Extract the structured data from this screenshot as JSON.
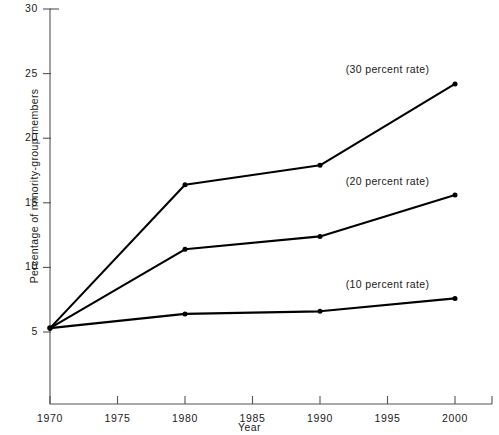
{
  "chart_data": {
    "type": "line",
    "title": "",
    "xlabel": "Year",
    "ylabel": "Percentage of minority-group members",
    "x": [
      1970,
      1980,
      1990,
      2000
    ],
    "xlim": [
      1970,
      2002
    ],
    "ylim": [
      0,
      30
    ],
    "xticks": [
      "1970",
      "1975",
      "1980",
      "1985",
      "1990",
      "1995",
      "2000"
    ],
    "xtick_values": [
      1970,
      1975,
      1980,
      1985,
      1990,
      1995,
      2000
    ],
    "yticks": [
      "5",
      "10",
      "15",
      "20",
      "25",
      "30"
    ],
    "ytick_values": [
      5,
      10,
      15,
      20,
      25,
      30
    ],
    "grid": false,
    "legend_position": "inline-right-annotations",
    "markers": "filled-circle",
    "series": [
      {
        "name": "(30 percent rate)",
        "values": [
          5.3,
          16.4,
          17.9,
          24.2
        ],
        "annotation": "(30 percent rate)"
      },
      {
        "name": "(20 percent rate)",
        "values": [
          5.3,
          11.4,
          12.4,
          15.6
        ],
        "annotation": "(20 percent rate)"
      },
      {
        "name": "(10 percent rate)",
        "values": [
          5.3,
          6.4,
          6.6,
          7.6
        ],
        "annotation": "(10 percent rate)"
      }
    ],
    "annotations": [
      {
        "text": "(30 percent rate)",
        "x": 1992.5,
        "y": 25.3
      },
      {
        "text": "(20 percent rate)",
        "x": 1992.5,
        "y": 16.6
      },
      {
        "text": "(10 percent rate)",
        "x": 1992.5,
        "y": 8.6
      }
    ],
    "axis_color": "#555555",
    "line_color": "#000000"
  }
}
